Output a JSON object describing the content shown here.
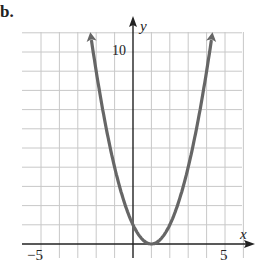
{
  "problem_label": "b.",
  "chart_data": {
    "type": "line",
    "title": "",
    "function": "y = (x - 1)^2",
    "xlabel": "x",
    "ylabel": "y",
    "xlim": [
      -6,
      6
    ],
    "ylim": [
      -0.5,
      11
    ],
    "x_ticks_labeled": [
      "-5",
      "5"
    ],
    "y_ticks_labeled": [
      "10"
    ],
    "grid": true,
    "grid_spacing": 1,
    "series": [
      {
        "name": "parabola",
        "color": "#666666",
        "x": [
          -2.3,
          -2,
          -1,
          0,
          1,
          2,
          3,
          4,
          4.3
        ],
        "y": [
          10.9,
          9,
          4,
          1,
          0,
          1,
          4,
          9,
          10.9
        ],
        "vertex": [
          1,
          0
        ],
        "arrows_both_ends": true
      }
    ]
  },
  "axes": {
    "x_label": "x",
    "y_label": "y",
    "x_min_label": "−5",
    "x_max_label": "5",
    "y_label_10": "10"
  }
}
